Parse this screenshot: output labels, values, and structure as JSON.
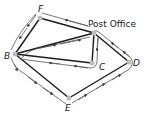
{
  "diagram": {
    "type": "route-network",
    "nodes": [
      {
        "id": "F",
        "label": "F"
      },
      {
        "id": "PO",
        "label": "Post Office"
      },
      {
        "id": "B",
        "label": "B"
      },
      {
        "id": "C",
        "label": "C"
      },
      {
        "id": "D",
        "label": "D"
      },
      {
        "id": "E",
        "label": "E"
      }
    ],
    "edges": [
      [
        "F",
        "PO"
      ],
      [
        "F",
        "B"
      ],
      [
        "B",
        "PO"
      ],
      [
        "B",
        "C"
      ],
      [
        "PO",
        "C"
      ],
      [
        "PO",
        "D"
      ],
      [
        "B",
        "E"
      ],
      [
        "E",
        "D"
      ]
    ],
    "route_order": [
      "PO",
      "F",
      "B",
      "PO",
      "C",
      "B",
      "E",
      "D",
      "PO"
    ],
    "colors": {
      "edge": "#1a1a1a",
      "route": "#555555",
      "node": "#bdbdbd"
    }
  }
}
